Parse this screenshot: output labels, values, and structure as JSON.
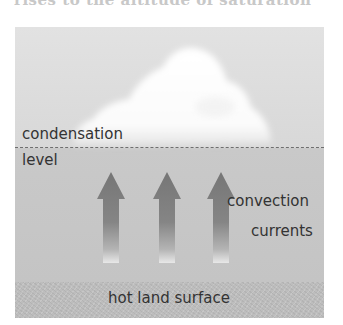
{
  "caption": {
    "text": "rises to the altitude of saturation"
  },
  "diagram": {
    "labels": {
      "condensation_line1": "condensation",
      "condensation_line2": "level",
      "convection_line1": "convection",
      "convection_line2": "currents",
      "ground": "hot land surface"
    },
    "arrows": [
      {
        "direction": "up",
        "center_x": 111
      },
      {
        "direction": "up",
        "center_x": 167
      },
      {
        "direction": "up",
        "center_x": 221
      }
    ],
    "colors": {
      "sky": "#dddddd",
      "air": "#c6c6c6",
      "ground": "#bdbdbd",
      "cloud": "#ffffff",
      "arrow": "#7a7a7a",
      "dashed_line": "#6e6e6e",
      "text": "#333333"
    }
  }
}
